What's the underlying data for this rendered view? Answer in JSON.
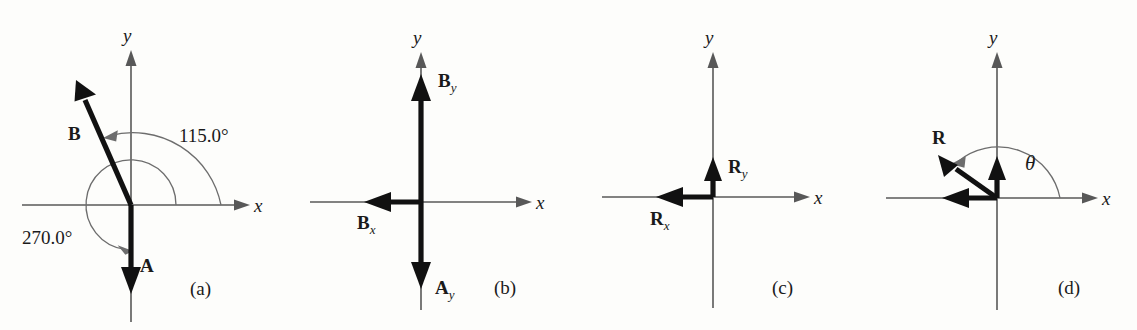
{
  "figure": {
    "type": "vector-addition-diagram",
    "panel_count": 4,
    "colors": {
      "vector": "#111111",
      "axis": "#585858",
      "arc": "#6d6d6d",
      "background": "#fdfdfb"
    }
  },
  "panels": [
    {
      "id": "a",
      "caption": "(a)",
      "axis_x_label": "x",
      "axis_y_label": "y",
      "vectors": [
        {
          "name": "B",
          "label": "B",
          "subscript": "",
          "direction": "up-left",
          "angle_deg": 115.0
        },
        {
          "name": "A",
          "label": "A",
          "subscript": "",
          "direction": "down",
          "angle_deg": 270.0
        }
      ],
      "annotations": [
        {
          "name": "angle-B",
          "label": "115.0°"
        },
        {
          "name": "angle-A",
          "label": "270.0°"
        }
      ]
    },
    {
      "id": "b",
      "caption": "(b)",
      "axis_x_label": "x",
      "axis_y_label": "y",
      "vectors": [
        {
          "name": "By",
          "label": "B",
          "subscript": "y",
          "direction": "up",
          "angle_deg": 90.0
        },
        {
          "name": "Bx",
          "label": "B",
          "subscript": "x",
          "direction": "left",
          "angle_deg": 180.0
        },
        {
          "name": "Ay",
          "label": "A",
          "subscript": "y",
          "direction": "down",
          "angle_deg": 270.0
        }
      ],
      "annotations": []
    },
    {
      "id": "c",
      "caption": "(c)",
      "axis_x_label": "x",
      "axis_y_label": "y",
      "vectors": [
        {
          "name": "Ry",
          "label": "R",
          "subscript": "y",
          "direction": "up",
          "angle_deg": 90.0
        },
        {
          "name": "Rx",
          "label": "R",
          "subscript": "x",
          "direction": "left",
          "angle_deg": 180.0
        }
      ],
      "annotations": []
    },
    {
      "id": "d",
      "caption": "(d)",
      "axis_x_label": "x",
      "axis_y_label": "y",
      "vectors": [
        {
          "name": "R",
          "label": "R",
          "subscript": "",
          "direction": "up-left",
          "angle_deg": 144.0
        },
        {
          "name": "Ry",
          "label": "",
          "subscript": "",
          "direction": "up",
          "angle_deg": 90.0
        },
        {
          "name": "Rx",
          "label": "",
          "subscript": "",
          "direction": "left",
          "angle_deg": 180.0
        }
      ],
      "annotations": [
        {
          "name": "angle-theta",
          "label": "θ"
        }
      ]
    }
  ]
}
